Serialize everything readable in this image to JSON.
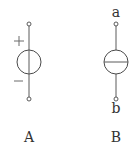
{
  "diagram": {
    "elements": [
      {
        "id": "A",
        "caption": "A",
        "type": "voltage-source",
        "polarity": {
          "top": "+",
          "bottom": "−"
        }
      },
      {
        "id": "B",
        "caption": "B",
        "type": "current-source",
        "terminals": {
          "top": "a",
          "bottom": "b"
        }
      }
    ]
  }
}
